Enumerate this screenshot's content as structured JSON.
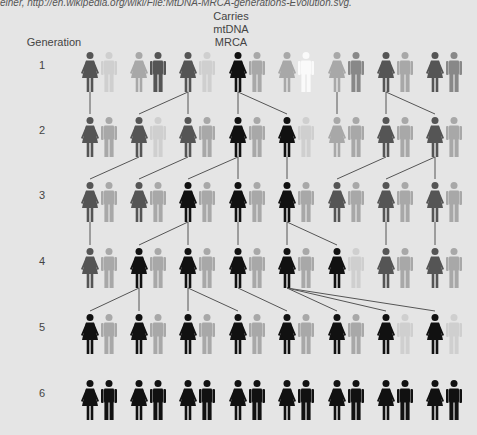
{
  "credit": "einer, http://en.wikipedia.org/wiki/File:MtDNA-MRCA-generations-Evolution.svg.",
  "header": {
    "generation_label": "Generation",
    "mrca_label_lines": [
      "Carries",
      "mtDNA",
      "MRCA"
    ]
  },
  "colors": {
    "background": "#e5e5e5",
    "line": "#555555",
    "black": "#111111",
    "dark": "#555555",
    "mid": "#888888",
    "light": "#a8a8a8",
    "faint": "#cfcfcf",
    "white": "#fafafa"
  },
  "layout": {
    "pair_x": [
      90,
      139,
      188,
      238,
      287,
      337,
      386,
      435
    ],
    "male_offset": 19,
    "row_head_y": [
      52,
      117,
      182,
      248,
      314,
      380
    ],
    "gen_label_y": [
      66,
      131,
      196,
      262,
      328,
      394
    ]
  },
  "generations": [
    {
      "number": "1",
      "pairs": [
        {
          "female": "dark",
          "male": "faint"
        },
        {
          "female": "light",
          "male": "dark"
        },
        {
          "female": "dark",
          "male": "faint"
        },
        {
          "female": "black",
          "male": "light"
        },
        {
          "female": "light",
          "male": "white"
        },
        {
          "female": "light",
          "male": "mid"
        },
        {
          "female": "dark",
          "male": "light"
        },
        {
          "female": "dark",
          "male": "mid"
        }
      ]
    },
    {
      "number": "2",
      "pairs": [
        {
          "female": "dark",
          "male": "light"
        },
        {
          "female": "dark",
          "male": "faint"
        },
        {
          "female": "dark",
          "male": "light"
        },
        {
          "female": "black",
          "male": "light"
        },
        {
          "female": "black",
          "male": "faint"
        },
        {
          "female": "light",
          "male": "light"
        },
        {
          "female": "dark",
          "male": "light"
        },
        {
          "female": "dark",
          "male": "light"
        }
      ]
    },
    {
      "number": "3",
      "pairs": [
        {
          "female": "dark",
          "male": "light"
        },
        {
          "female": "dark",
          "male": "light"
        },
        {
          "female": "black",
          "male": "light"
        },
        {
          "female": "black",
          "male": "light"
        },
        {
          "female": "black",
          "male": "light"
        },
        {
          "female": "dark",
          "male": "light"
        },
        {
          "female": "dark",
          "male": "light"
        },
        {
          "female": "dark",
          "male": "light"
        }
      ]
    },
    {
      "number": "4",
      "pairs": [
        {
          "female": "dark",
          "male": "light"
        },
        {
          "female": "black",
          "male": "light"
        },
        {
          "female": "black",
          "male": "light"
        },
        {
          "female": "black",
          "male": "light"
        },
        {
          "female": "black",
          "male": "light"
        },
        {
          "female": "black",
          "male": "faint"
        },
        {
          "female": "dark",
          "male": "light"
        },
        {
          "female": "dark",
          "male": "light"
        }
      ]
    },
    {
      "number": "5",
      "pairs": [
        {
          "female": "black",
          "male": "light"
        },
        {
          "female": "black",
          "male": "light"
        },
        {
          "female": "black",
          "male": "light"
        },
        {
          "female": "black",
          "male": "light"
        },
        {
          "female": "black",
          "male": "light"
        },
        {
          "female": "black",
          "male": "light"
        },
        {
          "female": "black",
          "male": "faint"
        },
        {
          "female": "black",
          "male": "faint"
        }
      ]
    },
    {
      "number": "6",
      "pairs": [
        {
          "female": "black",
          "male": "black"
        },
        {
          "female": "black",
          "male": "black"
        },
        {
          "female": "black",
          "male": "black"
        },
        {
          "female": "black",
          "male": "black"
        },
        {
          "female": "black",
          "male": "black"
        },
        {
          "female": "black",
          "male": "black"
        },
        {
          "female": "black",
          "male": "black"
        },
        {
          "female": "black",
          "male": "black"
        }
      ]
    }
  ],
  "lineage_links": [
    [
      [
        0,
        0
      ],
      [
        2,
        1
      ],
      [
        2,
        2
      ],
      [
        3,
        3
      ],
      [
        3,
        4
      ],
      [
        5,
        5
      ],
      [
        6,
        6
      ],
      [
        6,
        7
      ]
    ],
    [
      [
        1,
        0
      ],
      [
        2,
        1
      ],
      [
        3,
        2
      ],
      [
        3,
        3
      ],
      [
        4,
        4
      ],
      [
        6,
        5
      ],
      [
        7,
        6
      ],
      [
        7,
        7
      ]
    ],
    [
      [
        0,
        0
      ],
      [
        2,
        1
      ],
      [
        2,
        2
      ],
      [
        3,
        3
      ],
      [
        4,
        4
      ],
      [
        4,
        5
      ],
      [
        6,
        6
      ],
      [
        7,
        7
      ]
    ],
    [
      [
        1,
        0
      ],
      [
        1,
        1
      ],
      [
        2,
        2
      ],
      [
        2,
        3
      ],
      [
        3,
        4
      ],
      [
        4,
        5
      ],
      [
        4,
        6
      ],
      [
        4,
        7
      ]
    ]
  ]
}
